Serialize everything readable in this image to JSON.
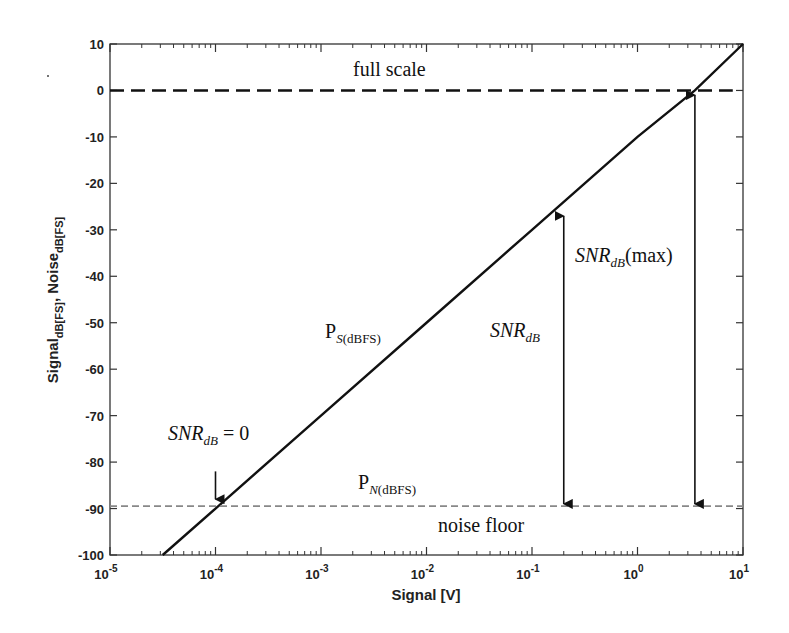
{
  "chart_data": {
    "type": "line",
    "title": "",
    "xlabel": "Signal [V]",
    "ylabel": "Signal dB[FS], Noise dB[FS]",
    "ylabel_parts": {
      "a": "Signal",
      "a_sub": "dB[FS]",
      "sep": ",",
      "b": "Noise",
      "b_sub": "dB[FS]"
    },
    "xscale": "log",
    "xlim": [
      1e-05,
      10
    ],
    "ylim": [
      -100,
      10
    ],
    "xticks": [
      1e-05,
      0.0001,
      0.001,
      0.01,
      0.1,
      1,
      10
    ],
    "xtick_labels": [
      {
        "base": "10",
        "exp": "-5"
      },
      {
        "base": "10",
        "exp": "-4"
      },
      {
        "base": "10",
        "exp": "-3"
      },
      {
        "base": "10",
        "exp": "-2"
      },
      {
        "base": "10",
        "exp": "-1"
      },
      {
        "base": "10",
        "exp": "0"
      },
      {
        "base": "10",
        "exp": "1"
      }
    ],
    "yticks": [
      10,
      0,
      -10,
      -20,
      -30,
      -40,
      -50,
      -60,
      -70,
      -80,
      -90,
      -100
    ],
    "ytick_labels": [
      "10",
      "0",
      "-10",
      "-20",
      "-30",
      "-40",
      "-50",
      "-60",
      "-70",
      "-80",
      "-90",
      "-100"
    ],
    "grid": false,
    "series": [
      {
        "name": "P_S(dBFS)",
        "style": "solid",
        "color": "#111111",
        "x": [
          3.16e-05,
          0.0001,
          0.001,
          0.01,
          0.1,
          1,
          3.5,
          10
        ],
        "y": [
          -100,
          -90,
          -70,
          -50,
          -30,
          -10,
          0,
          10
        ]
      },
      {
        "name": "full scale",
        "style": "dashed",
        "color": "#111111",
        "x": [
          1e-05,
          8
        ],
        "y": [
          0,
          0
        ]
      },
      {
        "name": "P_N(dBFS) noise floor",
        "style": "dashed",
        "color": "#888888",
        "x": [
          1e-05,
          10
        ],
        "y": [
          -89.5,
          -89.5
        ]
      }
    ],
    "annotations": [
      {
        "text": "full scale",
        "x": 0.05,
        "y": 4
      },
      {
        "text": "noise floor",
        "x": 0.05,
        "y": -94
      },
      {
        "text": "P",
        "sub": "S(dBFS)",
        "x": 0.0012,
        "y": -52
      },
      {
        "text": "P",
        "sub": "N(dBFS)",
        "x": 0.012,
        "y": -85
      },
      {
        "text": "SNR",
        "sub": "dB",
        "x": 0.18,
        "y": -55
      },
      {
        "text": "SNR",
        "sub": "dB",
        "suffix": "(max)",
        "x": 0.3,
        "y": -36
      },
      {
        "text": "SNR",
        "sub": "dB",
        "suffix": " = 0",
        "x": 5e-05,
        "y": -76
      },
      {
        "arrow": "double",
        "x": 0.2,
        "y_from": -27,
        "y_to": -89
      },
      {
        "arrow": "double",
        "x": 3.5,
        "y_from": -1,
        "y_to": -89
      },
      {
        "arrow": "down",
        "x": 0.0001,
        "y_from": -82,
        "y_to": -88
      }
    ]
  }
}
